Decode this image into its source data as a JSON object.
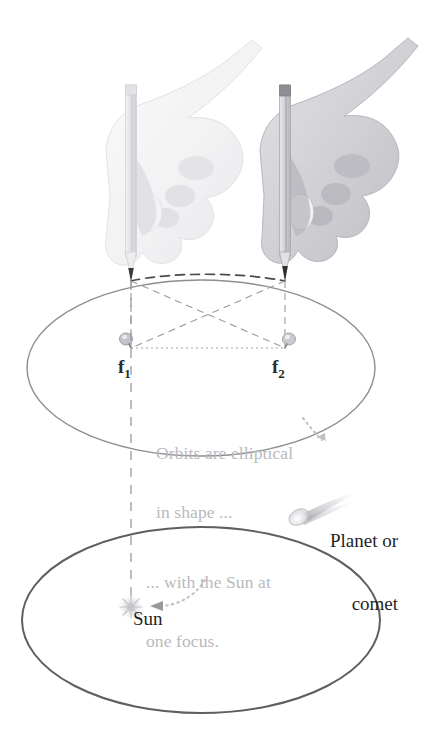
{
  "figure": {
    "background_color": "#ffffff",
    "labels": {
      "focus_1": "f",
      "focus_1_sub": "1",
      "focus_2": "f",
      "focus_2_sub": "2",
      "annotation_orbits_line1": "Orbits are elliptical",
      "annotation_orbits_line2": "in shape ...",
      "annotation_focus_line1": "... with the Sun at",
      "annotation_focus_line2": "one focus.",
      "callout_planet_line1": "Planet or",
      "callout_planet_line2": "comet",
      "label_sun": "Sun"
    },
    "colors": {
      "ellipse_upper_stroke": "#8d8d93",
      "ellipse_lower_stroke": "#5e5e63",
      "annotation_text": "#b9b9bd",
      "primary_text": "#1f1f1f",
      "focus_text": "#2b2b2b",
      "dashed_guide": "#9a9aa0",
      "dark_dash": "#4a4a4f",
      "hand_light": "#e9e9ec",
      "hand_dark": "#c9c9ce",
      "pencil_body": "#dedee2",
      "pencil_tip": "#3a3a3f",
      "comet_head": "#efefef",
      "comet_tail": "#c6c6cb",
      "sun_glow": "#e2e2e6"
    },
    "geometry": {
      "upper_ellipse": {
        "cx": 201,
        "cy": 368,
        "rx": 174,
        "ry": 88
      },
      "lower_ellipse": {
        "cx": 201,
        "cy": 620,
        "rx": 179,
        "ry": 93
      },
      "focus_1": {
        "x": 131,
        "y": 348
      },
      "focus_2": {
        "x": 285,
        "y": 348
      },
      "pencil_tip_left": {
        "x": 131,
        "y": 281
      },
      "pencil_tip_right": {
        "x": 285,
        "y": 281
      },
      "sun": {
        "x": 131,
        "y": 607
      },
      "comet": {
        "x": 299,
        "y": 513
      },
      "vertical_dashed_line": {
        "x": 131,
        "y_top": 281,
        "y_bottom": 600
      }
    },
    "icons": {
      "hand_left": "hand-holding-pencil-icon",
      "hand_right": "hand-holding-pencil-icon",
      "tack_1": "thumbtack-icon",
      "tack_2": "thumbtack-icon",
      "sun": "sun-icon",
      "comet": "comet-icon",
      "arrow_orbits": "dotted-arrow-icon",
      "arrow_focus": "dotted-arrow-icon"
    }
  }
}
